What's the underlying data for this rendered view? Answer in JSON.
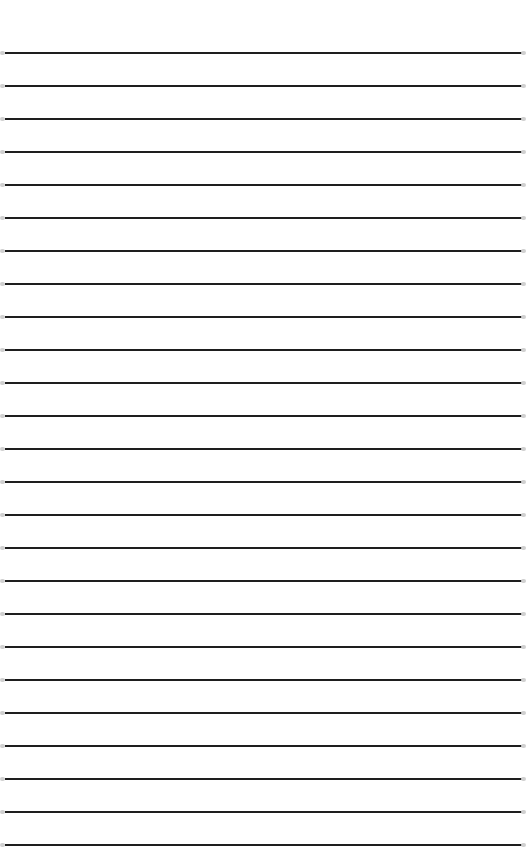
{
  "document": {
    "type": "lined-paper",
    "line_count": 25,
    "first_line_y": 53,
    "line_spacing": 33,
    "line_color": "#1e1e1e",
    "background_color": "#ffffff",
    "text": ""
  }
}
